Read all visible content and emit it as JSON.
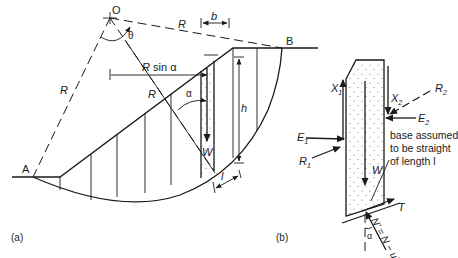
{
  "figure": {
    "panel_a": {
      "label": "(a)",
      "points": {
        "center": "O",
        "toe": "A",
        "crest": "B"
      },
      "labels": {
        "radius_top": "R",
        "radius_left": "R",
        "radius_slice": "R",
        "theta": "θ",
        "slice_width": "b",
        "moment_arm": "R sin α",
        "moment_arm_R": "R",
        "moment_arm_rest": " sin α",
        "alpha": "α",
        "height": "h",
        "weight": "W",
        "base_length": "l"
      }
    },
    "panel_b": {
      "label": "(b)",
      "forces": {
        "X1": "X",
        "X1_sub": "1",
        "X2": "X",
        "X2_sub": "2",
        "E1": "E",
        "E1_sub": "1",
        "E2": "E",
        "E2_sub": "2",
        "R1": "R",
        "R1_sub": "1",
        "R2": "R",
        "R2_sub": "2",
        "W": "W",
        "T": "T",
        "N": "N' = N − ul",
        "alpha": "α"
      },
      "note_lines": [
        "base assumed",
        "to be straight",
        "of length l"
      ]
    },
    "colors": {
      "ink": "#1a1a1a",
      "background": "#ffffff",
      "stipple": "#777777"
    }
  }
}
